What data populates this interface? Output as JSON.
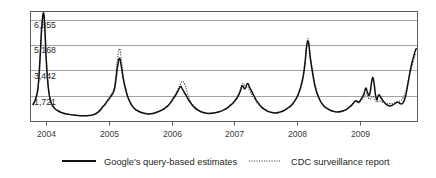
{
  "chart_data": {
    "type": "line",
    "title": "",
    "subtitle": "",
    "xlabel": "",
    "ylabel": "",
    "grid": true,
    "legend_position": "bottom",
    "xlim": [
      2003.75,
      2009.92
    ],
    "ylim": [
      0,
      7400
    ],
    "xticks": [
      "2004",
      "2005",
      "2006",
      "2007",
      "2008",
      "2009"
    ],
    "xtick_values": [
      2004,
      2005,
      2006,
      2007,
      2008,
      2009
    ],
    "yticks": [
      "1,721",
      "3,442",
      "5,168",
      "6,855"
    ],
    "ytick_values": [
      1721,
      3442,
      5168,
      6855
    ],
    "series": [
      {
        "name": "Google's query-based estimates",
        "style": "solid",
        "color": "#111111",
        "x": [
          2003.79,
          2003.83,
          2003.87,
          2003.9,
          2003.93,
          2003.96,
          2003.98,
          2004.0,
          2004.02,
          2004.04,
          2004.06,
          2004.09,
          2004.13,
          2004.17,
          2004.23,
          2004.29,
          2004.36,
          2004.44,
          2004.52,
          2004.6,
          2004.67,
          2004.73,
          2004.79,
          2004.83,
          2004.87,
          2004.9,
          2004.94,
          2004.97,
          2005.0,
          2005.02,
          2005.05,
          2005.08,
          2005.1,
          2005.12,
          2005.14,
          2005.17,
          2005.2,
          2005.23,
          2005.27,
          2005.31,
          2005.37,
          2005.44,
          2005.52,
          2005.6,
          2005.67,
          2005.75,
          2005.81,
          2005.86,
          2005.9,
          2005.94,
          2005.98,
          2006.02,
          2006.06,
          2006.1,
          2006.14,
          2006.17,
          2006.21,
          2006.25,
          2006.29,
          2006.35,
          2006.42,
          2006.5,
          2006.58,
          2006.65,
          2006.73,
          2006.79,
          2006.85,
          2006.9,
          2006.94,
          2006.98,
          2007.02,
          2007.06,
          2007.1,
          2007.13,
          2007.17,
          2007.21,
          2007.25,
          2007.31,
          2007.37,
          2007.44,
          2007.52,
          2007.6,
          2007.67,
          2007.73,
          2007.79,
          2007.85,
          2007.9,
          2007.94,
          2007.98,
          2008.02,
          2008.06,
          2008.1,
          2008.13,
          2008.15,
          2008.17,
          2008.19,
          2008.21,
          2008.25,
          2008.29,
          2008.35,
          2008.42,
          2008.5,
          2008.58,
          2008.65,
          2008.73,
          2008.79,
          2008.83,
          2008.87,
          2008.9,
          2008.94,
          2008.98,
          2009.02,
          2009.06,
          2009.08,
          2009.1,
          2009.12,
          2009.15,
          2009.17,
          2009.19,
          2009.21,
          2009.23,
          2009.25,
          2009.27,
          2009.29,
          2009.31,
          2009.33,
          2009.37,
          2009.42,
          2009.48,
          2009.54,
          2009.6,
          2009.65,
          2009.69,
          2009.73,
          2009.77,
          2009.81,
          2009.85,
          2009.88,
          2009.9
        ],
        "y": [
          1150,
          1500,
          2300,
          4100,
          6400,
          7300,
          6100,
          4200,
          2900,
          2050,
          1550,
          1150,
          900,
          760,
          620,
          540,
          480,
          430,
          400,
          380,
          400,
          430,
          520,
          640,
          800,
          980,
          1150,
          1350,
          1500,
          1620,
          1800,
          2050,
          2450,
          3100,
          3750,
          4250,
          3650,
          2850,
          2100,
          1550,
          1050,
          760,
          600,
          520,
          520,
          600,
          700,
          800,
          920,
          1050,
          1250,
          1500,
          1750,
          2050,
          2350,
          2200,
          1900,
          1600,
          1320,
          1000,
          760,
          600,
          540,
          560,
          620,
          700,
          820,
          950,
          1100,
          1250,
          1450,
          1700,
          2100,
          2400,
          2200,
          2550,
          2250,
          1750,
          1300,
          950,
          720,
          600,
          580,
          640,
          740,
          900,
          1050,
          1250,
          1500,
          1850,
          2350,
          3100,
          4100,
          5000,
          5400,
          5100,
          4300,
          3200,
          2300,
          1550,
          1080,
          820,
          680,
          640,
          700,
          820,
          950,
          1100,
          1250,
          1400,
          1300,
          1500,
          1800,
          2050,
          2250,
          2000,
          1750,
          2100,
          2700,
          2950,
          2500,
          1800,
          1450,
          1700,
          1800,
          1650,
          1400,
          1150,
          1050,
          1150,
          1300,
          1200,
          1250,
          1700,
          2600,
          3550,
          4250,
          4700,
          4900
        ],
        "peaks": [
          {
            "year": 2004,
            "value": 7300,
            "note": "clipped at plot top"
          },
          {
            "year": 2005,
            "value": 4250
          },
          {
            "year": 2006,
            "value": 2350
          },
          {
            "year": 2007,
            "value": 2550
          },
          {
            "year": 2008,
            "value": 5400
          },
          {
            "year": 2009,
            "value": 4900,
            "note": "rising at right edge"
          }
        ]
      },
      {
        "name": "CDC surveillance report",
        "style": "dotted",
        "color": "#3b3b3b",
        "x": [
          2003.79,
          2003.83,
          2003.87,
          2003.9,
          2003.93,
          2003.96,
          2003.98,
          2004.0,
          2004.02,
          2004.04,
          2004.06,
          2004.09,
          2004.13,
          2004.17,
          2004.23,
          2004.29,
          2004.36,
          2004.44,
          2004.52,
          2004.6,
          2004.67,
          2004.73,
          2004.79,
          2004.83,
          2004.87,
          2004.9,
          2004.94,
          2004.97,
          2005.0,
          2005.02,
          2005.05,
          2005.08,
          2005.1,
          2005.12,
          2005.14,
          2005.17,
          2005.2,
          2005.23,
          2005.27,
          2005.31,
          2005.37,
          2005.44,
          2005.52,
          2005.6,
          2005.67,
          2005.75,
          2005.81,
          2005.86,
          2005.9,
          2005.94,
          2005.98,
          2006.02,
          2006.06,
          2006.1,
          2006.14,
          2006.17,
          2006.21,
          2006.25,
          2006.29,
          2006.35,
          2006.42,
          2006.5,
          2006.58,
          2006.65,
          2006.73,
          2006.79,
          2006.85,
          2006.9,
          2006.94,
          2006.98,
          2007.02,
          2007.06,
          2007.1,
          2007.13,
          2007.17,
          2007.21,
          2007.25,
          2007.31,
          2007.37,
          2007.44,
          2007.52,
          2007.6,
          2007.67,
          2007.73,
          2007.79,
          2007.85,
          2007.9,
          2007.94,
          2007.98,
          2008.02,
          2008.06,
          2008.1,
          2008.13,
          2008.15,
          2008.17,
          2008.19,
          2008.21,
          2008.25,
          2008.29,
          2008.35,
          2008.42,
          2008.5,
          2008.58,
          2008.65,
          2008.73,
          2008.79,
          2008.83,
          2008.87,
          2008.9,
          2008.94,
          2008.98,
          2009.02,
          2009.06,
          2009.08,
          2009.1,
          2009.12,
          2009.15,
          2009.17,
          2009.19,
          2009.21,
          2009.23,
          2009.25,
          2009.27,
          2009.29,
          2009.31,
          2009.33,
          2009.37,
          2009.42,
          2009.48,
          2009.54,
          2009.6,
          2009.65,
          2009.69,
          2009.73,
          2009.77,
          2009.81,
          2009.85,
          2009.88,
          2009.9
        ],
        "y": [
          1100,
          1450,
          2200,
          3900,
          6200,
          7100,
          6300,
          4500,
          3100,
          2150,
          1600,
          1200,
          920,
          770,
          630,
          545,
          485,
          435,
          405,
          385,
          405,
          435,
          530,
          660,
          830,
          1020,
          1200,
          1400,
          1560,
          1700,
          1900,
          2200,
          2700,
          3500,
          4300,
          4900,
          4100,
          3000,
          2200,
          1600,
          1080,
          780,
          610,
          525,
          525,
          610,
          710,
          810,
          930,
          1070,
          1280,
          1540,
          1800,
          2150,
          2500,
          2700,
          2500,
          1950,
          1450,
          1080,
          790,
          615,
          550,
          570,
          630,
          710,
          830,
          965,
          1120,
          1280,
          1500,
          1780,
          2200,
          2560,
          2400,
          2350,
          2000,
          1600,
          1220,
          920,
          710,
          595,
          575,
          635,
          735,
          890,
          1040,
          1240,
          1480,
          1820,
          2300,
          3000,
          3950,
          4850,
          5550,
          5250,
          4450,
          3350,
          2400,
          1600,
          1110,
          840,
          690,
          645,
          705,
          830,
          965,
          1120,
          1270,
          1350,
          1250,
          1400,
          1600,
          1750,
          1900,
          1750,
          1500,
          1550,
          1650,
          1700,
          1550,
          1400,
          1300,
          1350,
          1400,
          1350,
          1300,
          1250,
          1200,
          1250,
          1350,
          1400,
          1600,
          2000,
          2700,
          3400,
          4000,
          4400,
          4600
        ],
        "peaks": [
          {
            "year": 2004,
            "value": 7100,
            "note": "clipped at plot top"
          },
          {
            "year": 2005,
            "value": 4900
          },
          {
            "year": 2006,
            "value": 2700
          },
          {
            "year": 2007,
            "value": 2560
          },
          {
            "year": 2008,
            "value": 5550
          },
          {
            "year": 2009,
            "value": 4600
          }
        ]
      }
    ],
    "legend": [
      {
        "label": "Google's query-based estimates",
        "style": "solid"
      },
      {
        "label": "CDC surveillance report",
        "style": "dotted"
      }
    ]
  },
  "legend": {
    "items": [
      {
        "label": "Google's query-based estimates"
      },
      {
        "label": "CDC surveillance report"
      }
    ]
  }
}
